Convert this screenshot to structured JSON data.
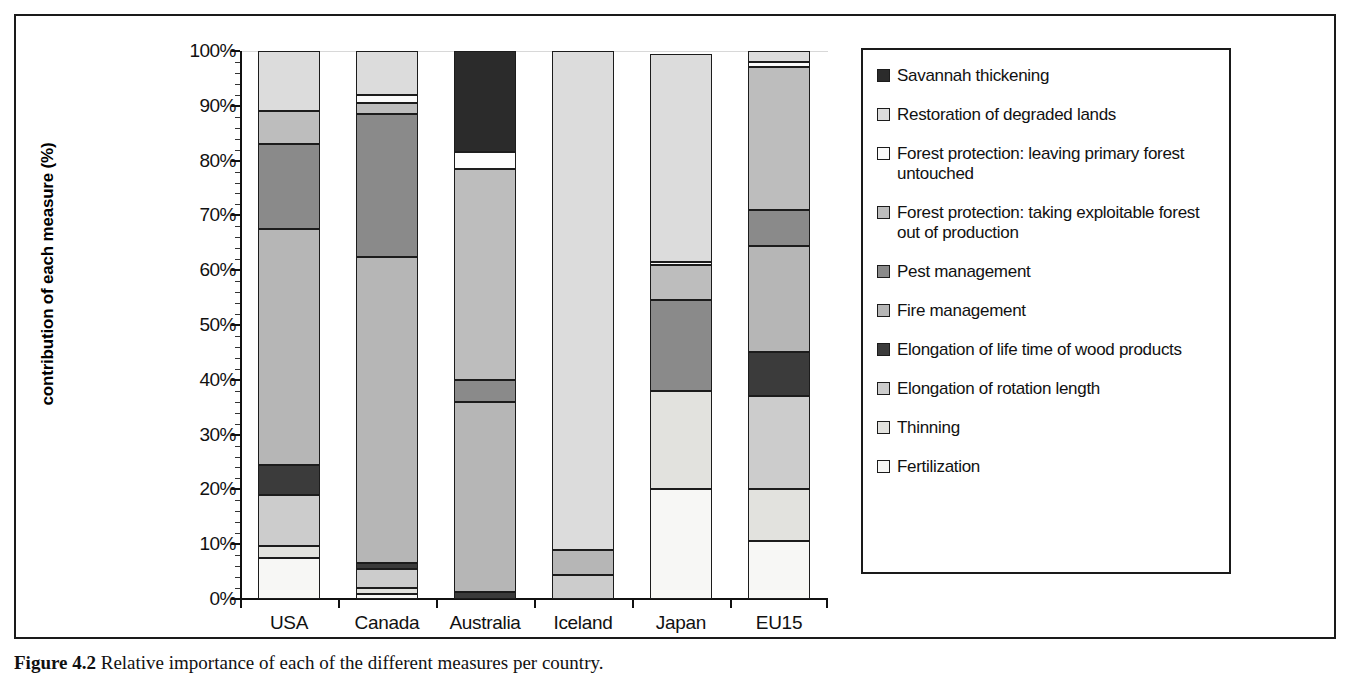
{
  "figure": {
    "caption_label": "Figure 4.2",
    "caption_text": "Relative importance of each of the different measures per country."
  },
  "chart_data": {
    "type": "bar",
    "subtype": "stacked-percentage",
    "title": "",
    "xlabel": "",
    "ylabel": "contribution of each measure (%)",
    "ylim": [
      0,
      100
    ],
    "ytick_labels": [
      "0%",
      "10%",
      "20%",
      "30%",
      "40%",
      "50%",
      "60%",
      "70%",
      "80%",
      "90%",
      "100%"
    ],
    "ytick_values": [
      0,
      10,
      20,
      30,
      40,
      50,
      60,
      70,
      80,
      90,
      100
    ],
    "grid": false,
    "legend_position": "right",
    "categories": [
      "USA",
      "Canada",
      "Australia",
      "Iceland",
      "Japan",
      "EU15"
    ],
    "series": [
      {
        "name": "Fertilization",
        "color": "#f7f7f5",
        "values": [
          7.5,
          1.0,
          0.0,
          0.0,
          20.0,
          10.5
        ]
      },
      {
        "name": "Thinning",
        "color": "#e2e2de",
        "values": [
          2.2,
          1.0,
          0.0,
          0.0,
          18.0,
          9.5
        ]
      },
      {
        "name": "Elongation of rotation length",
        "color": "#cccccc",
        "values": [
          9.3,
          3.5,
          0.0,
          4.3,
          0.0,
          17.0
        ]
      },
      {
        "name": "Elongation of life time of wood products",
        "color": "#3b3b3b",
        "values": [
          5.5,
          1.0,
          1.3,
          0.0,
          0.0,
          8.0
        ]
      },
      {
        "name": "Fire management",
        "color": "#b6b6b6",
        "values": [
          43.0,
          56.0,
          34.7,
          4.7,
          0.0,
          19.5
        ]
      },
      {
        "name": "Pest management",
        "color": "#8a8a8a",
        "values": [
          15.5,
          26.0,
          4.0,
          0.0,
          16.5,
          6.5
        ]
      },
      {
        "name": "Forest protection: taking exploitable forest out of production",
        "color": "#bdbdbd",
        "values": [
          6.0,
          2.0,
          38.5,
          0.0,
          6.5,
          26.0
        ]
      },
      {
        "name": "Forest protection: leaving primary forest untouched",
        "color": "#fbfbfb",
        "values": [
          0.0,
          1.5,
          3.0,
          0.0,
          0.5,
          1.0
        ]
      },
      {
        "name": "Restoration of degraded lands",
        "color": "#dcdcdc",
        "values": [
          11.0,
          8.0,
          0.0,
          91.0,
          38.0,
          2.0
        ]
      },
      {
        "name": "Savannah thickening",
        "color": "#2b2b2b",
        "values": [
          0.0,
          0.0,
          18.5,
          0.0,
          0.0,
          0.0
        ]
      }
    ],
    "stack_order_bottom_to_top": [
      "Fertilization",
      "Thinning",
      "Elongation of rotation length",
      "Elongation of life time of wood products",
      "Fire management",
      "Pest management",
      "Forest protection: taking exploitable forest out of production",
      "Forest protection: leaving primary forest untouched",
      "Restoration of degraded lands",
      "Savannah thickening"
    ]
  },
  "legend": {
    "items": [
      {
        "label": "Savannah thickening",
        "color": "#2b2b2b"
      },
      {
        "label": "Restoration of degraded lands",
        "color": "#dcdcdc"
      },
      {
        "label": "Forest protection: leaving primary forest untouched",
        "color": "#fbfbfb"
      },
      {
        "label": "Forest protection: taking exploitable forest out of production",
        "color": "#bdbdbd"
      },
      {
        "label": "Pest management",
        "color": "#8a8a8a"
      },
      {
        "label": "Fire management",
        "color": "#b6b6b6"
      },
      {
        "label": "Elongation of life time of wood products",
        "color": "#3b3b3b"
      },
      {
        "label": "Elongation of rotation length",
        "color": "#cccccc"
      },
      {
        "label": "Thinning",
        "color": "#e2e2de"
      },
      {
        "label": "Fertilization",
        "color": "#f7f7f5"
      }
    ]
  }
}
